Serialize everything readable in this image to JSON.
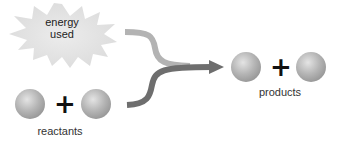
{
  "diagram": {
    "energy_label_line1": "energy",
    "energy_label_line2": "used",
    "reactants_label": "reactants",
    "products_label": "products",
    "plus_symbol": "+",
    "colors": {
      "energy_path": "#b3b3b3",
      "reaction_path": "#6e6e6e",
      "starburst": "#e6e6e6",
      "sphere": "#b8b8b8"
    }
  }
}
